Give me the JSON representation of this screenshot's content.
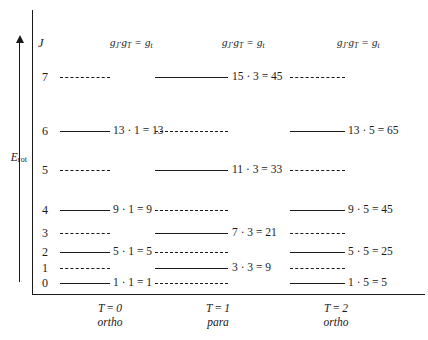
{
  "axes": {
    "y_label_main": "E",
    "y_label_sub": "rot",
    "j_heading": "J"
  },
  "column_headers": [
    {
      "gj": "g",
      "gj_sub": "J",
      "dot": "·",
      "gt": "g",
      "gt_sub": "T",
      "equals": "=",
      "result": "g",
      "result_sub": "t"
    },
    {
      "gj": "g",
      "gj_sub": "J",
      "dot": "·",
      "gt": "g",
      "gt_sub": "T",
      "equals": "=",
      "result": "g",
      "result_sub": "t"
    },
    {
      "gj": "g",
      "gj_sub": "J",
      "dot": "·",
      "gt": "g",
      "gt_sub": "T",
      "equals": "=",
      "result": "g",
      "result_sub": "t"
    }
  ],
  "rows": [
    {
      "j": "7",
      "cells": [
        {
          "style": "dashed",
          "label": ""
        },
        {
          "style": "solid",
          "label": "15 · 3  = 45"
        },
        {
          "style": "dashed",
          "label": ""
        }
      ]
    },
    {
      "j": "6",
      "cells": [
        {
          "style": "solid",
          "label": "13 · 1  = 13"
        },
        {
          "style": "dashed",
          "label": ""
        },
        {
          "style": "solid",
          "label": "13 · 5  = 65"
        }
      ]
    },
    {
      "j": "5",
      "cells": [
        {
          "style": "dashed",
          "label": ""
        },
        {
          "style": "solid",
          "label": "11 · 3  = 33"
        },
        {
          "style": "dashed",
          "label": ""
        }
      ]
    },
    {
      "j": "4",
      "cells": [
        {
          "style": "solid",
          "label": "9 · 1  = 9"
        },
        {
          "style": "dashed",
          "label": ""
        },
        {
          "style": "solid",
          "label": "9 · 5  = 45"
        }
      ]
    },
    {
      "j": "3",
      "cells": [
        {
          "style": "dashed",
          "label": ""
        },
        {
          "style": "solid",
          "label": "7 · 3  = 21"
        },
        {
          "style": "dashed",
          "label": ""
        }
      ]
    },
    {
      "j": "2",
      "cells": [
        {
          "style": "solid",
          "label": "5 · 1  = 5"
        },
        {
          "style": "dashed",
          "label": ""
        },
        {
          "style": "solid",
          "label": "5 · 5  = 25"
        }
      ]
    },
    {
      "j": "1",
      "cells": [
        {
          "style": "dashed",
          "label": ""
        },
        {
          "style": "solid",
          "label": "3 · 3  = 9"
        },
        {
          "style": "dashed",
          "label": ""
        }
      ]
    },
    {
      "j": "0",
      "cells": [
        {
          "style": "solid",
          "label": "1 · 1  = 1"
        },
        {
          "style": "dashed",
          "label": ""
        },
        {
          "style": "solid",
          "label": "1 · 5  = 5"
        }
      ]
    }
  ],
  "columns_footer": [
    {
      "t_label": "T",
      "equals": "=",
      "t_value": "0",
      "species": "ortho"
    },
    {
      "t_label": "T",
      "equals": "=",
      "t_value": "1",
      "species": "para"
    },
    {
      "t_label": "T",
      "equals": "=",
      "t_value": "2",
      "species": "ortho"
    }
  ],
  "layout": {
    "row_y": [
      77,
      131,
      170,
      210,
      233,
      252,
      268,
      283
    ],
    "col_line_x": [
      60,
      155,
      290
    ],
    "col_line_w": [
      50,
      73,
      55
    ],
    "col_label_x": [
      113,
      232,
      348
    ]
  },
  "colors": {
    "ink": "#1a1a1a",
    "background": "#ffffff"
  }
}
